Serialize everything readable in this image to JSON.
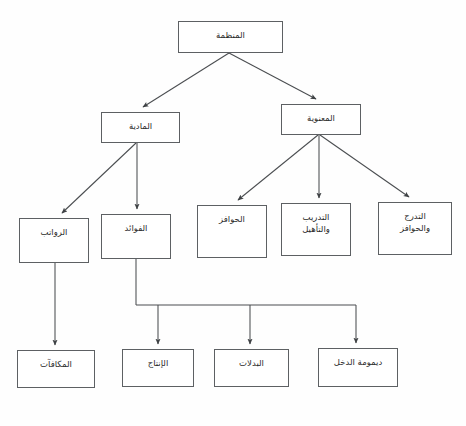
{
  "diagram": {
    "direction": "rtl",
    "background_color": "#fefefe",
    "box_border_color": "#5d6063",
    "connector_color": "#4a4d50",
    "text_color": "#2b2b2b",
    "nodes": [
      {
        "id": "organization",
        "label": "المنظمة",
        "x": 178,
        "y": 21,
        "w": 105,
        "h": 32
      },
      {
        "id": "material",
        "label": "المادية",
        "x": 101,
        "y": 112,
        "w": 79,
        "h": 31
      },
      {
        "id": "moral",
        "label": "المعنوية",
        "x": 281,
        "y": 104,
        "w": 80,
        "h": 31
      },
      {
        "id": "salaries",
        "label": "الرواتب",
        "x": 19,
        "y": 218,
        "w": 70,
        "h": 45
      },
      {
        "id": "benefits",
        "label": "الفوائد",
        "x": 101,
        "y": 214,
        "w": 70,
        "h": 45
      },
      {
        "id": "incentives",
        "label": "الحوافز",
        "x": 197,
        "y": 205,
        "w": 70,
        "h": 53
      },
      {
        "id": "training",
        "label": "التدريب\nوالتأهيل",
        "x": 281,
        "y": 203,
        "w": 70,
        "h": 53
      },
      {
        "id": "progression",
        "label": "التدرج\nوالحوافز",
        "x": 378,
        "y": 202,
        "w": 74,
        "h": 53
      },
      {
        "id": "bonuses",
        "label": "المكافآت",
        "x": 17,
        "y": 350,
        "w": 78,
        "h": 38
      },
      {
        "id": "production",
        "label": "الإنتاج",
        "x": 122,
        "y": 349,
        "w": 72,
        "h": 38
      },
      {
        "id": "allowances",
        "label": "البدلات",
        "x": 214,
        "y": 349,
        "w": 75,
        "h": 38
      },
      {
        "id": "income_cont",
        "label": "ديمومة الدخل",
        "x": 318,
        "y": 348,
        "w": 80,
        "h": 39
      }
    ],
    "connectors": [
      {
        "id": "org-to-material",
        "from": "organization",
        "to": "material",
        "type": "diagonal"
      },
      {
        "id": "org-to-moral",
        "from": "organization",
        "to": "moral",
        "type": "diagonal"
      },
      {
        "id": "material-to-salaries",
        "from": "material",
        "to": "salaries",
        "type": "diagonal"
      },
      {
        "id": "material-to-benefits",
        "from": "material",
        "to": "benefits",
        "type": "straight"
      },
      {
        "id": "moral-to-incentives",
        "from": "moral",
        "to": "incentives",
        "type": "diagonal"
      },
      {
        "id": "moral-to-training",
        "from": "moral",
        "to": "training",
        "type": "straight"
      },
      {
        "id": "moral-to-progression",
        "from": "moral",
        "to": "progression",
        "type": "diagonal"
      },
      {
        "id": "salaries-to-bonuses",
        "from": "salaries",
        "to": "bonuses",
        "type": "straight"
      },
      {
        "id": "benefits-to-production",
        "from": "benefits",
        "to": "production",
        "type": "orthogonal-bus"
      },
      {
        "id": "benefits-to-allowances",
        "from": "benefits",
        "to": "allowances",
        "type": "orthogonal-bus"
      },
      {
        "id": "benefits-to-income",
        "from": "benefits",
        "to": "income_cont",
        "type": "orthogonal-bus"
      }
    ],
    "bus": {
      "id": "benefits-bus",
      "y": 305,
      "x_start": 136,
      "x_end": 356
    }
  }
}
